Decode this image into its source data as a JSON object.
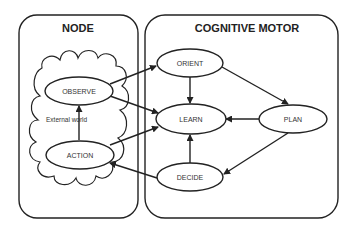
{
  "diagram": {
    "panels": [
      {
        "id": "node",
        "title": "NODE"
      },
      {
        "id": "cognitive",
        "title": "COGNITIVE MOTOR"
      }
    ],
    "cloud_label": "External world",
    "nodes": {
      "observe": "OBSERVE",
      "action": "ACTION",
      "orient": "ORIENT",
      "learn": "LEARN",
      "plan": "PLAN",
      "decide": "DECIDE"
    },
    "edges": [
      {
        "from": "ACTION",
        "to": "OBSERVE"
      },
      {
        "from": "OBSERVE",
        "to": "ORIENT"
      },
      {
        "from": "OBSERVE",
        "to": "LEARN"
      },
      {
        "from": "ORIENT",
        "to": "LEARN"
      },
      {
        "from": "ORIENT",
        "to": "PLAN"
      },
      {
        "from": "PLAN",
        "to": "LEARN"
      },
      {
        "from": "PLAN",
        "to": "DECIDE"
      },
      {
        "from": "DECIDE",
        "to": "LEARN"
      },
      {
        "from": "DECIDE",
        "to": "ACTION"
      },
      {
        "from": "ACTION",
        "to": "LEARN"
      }
    ],
    "colors": {
      "stroke": "#222222",
      "background": "#ffffff"
    }
  }
}
